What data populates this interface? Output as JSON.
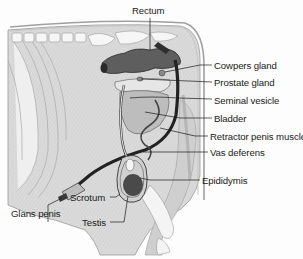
{
  "diagram": {
    "labels": [
      {
        "id": "rectum",
        "text": "Rectum"
      },
      {
        "id": "cowpers-gland",
        "text": "Cowpers gland"
      },
      {
        "id": "prostate-gland",
        "text": "Prostate gland"
      },
      {
        "id": "seminal-vesicle",
        "text": "Seminal vesicle"
      },
      {
        "id": "bladder",
        "text": "Bladder"
      },
      {
        "id": "retractor-penis-muscle",
        "text": "Retractor penis muscle"
      },
      {
        "id": "vas-deferens",
        "text": "Vas deferens"
      },
      {
        "id": "epididymis",
        "text": "Epididymis"
      },
      {
        "id": "glans-penis",
        "text": "Glans penis"
      },
      {
        "id": "scrotum",
        "text": "Scrotum"
      },
      {
        "id": "testis",
        "text": "Testis"
      }
    ],
    "colors": {
      "body_fill": "#d9d9d9",
      "bone_fill": "#f2f2f2",
      "rectum_fill": "#5c5c5c",
      "organ_light": "#c4c4c4",
      "organ_mid": "#a6a6a6",
      "testis_fill": "#4a4a4a",
      "line": "#222222"
    }
  }
}
